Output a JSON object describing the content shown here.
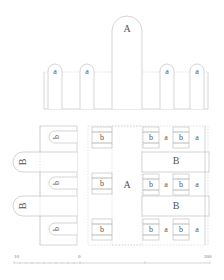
{
  "elevation": {
    "large_arch_label": "A",
    "small_arch_labels": [
      "a",
      "a",
      "a",
      "a"
    ]
  },
  "plan": {
    "left_wing": {
      "B_labels": [
        "B",
        "B"
      ],
      "b_labels": [
        "b",
        "b",
        "b"
      ]
    },
    "center": {
      "A_label": "A",
      "b_labels": [
        "b",
        "b",
        "b"
      ]
    },
    "right_wing": {
      "rows": [
        [
          "b",
          "a",
          "b",
          "a"
        ],
        [
          "b",
          "a",
          "b",
          "a"
        ],
        [
          "b",
          "a",
          "b",
          "a"
        ]
      ],
      "B_labels": [
        "B",
        "B"
      ]
    }
  },
  "scale_bar": {
    "left_label": "10",
    "mid_label": "0",
    "right_label": "200"
  }
}
